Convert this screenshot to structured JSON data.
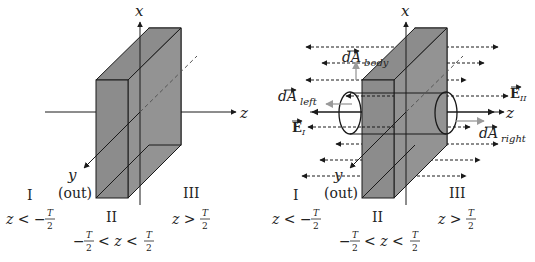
{
  "left_panel": {
    "axis_labels": {
      "x": "x",
      "z": "z",
      "y": "y",
      "y_note": "(out)"
    },
    "regions": [
      {
        "numeral": "I",
        "condition_lhs": "z < −",
        "frac_num": "T",
        "frac_den": "2"
      },
      {
        "numeral": "II",
        "condition_pre": "−",
        "frac_num": "T",
        "frac_den": "2",
        "condition_mid": "< z <",
        "frac2_num": "T",
        "frac2_den": "2"
      },
      {
        "numeral": "III",
        "condition_lhs": "z >",
        "frac_num": "T",
        "frac_den": "2"
      }
    ]
  },
  "right_panel": {
    "axis_labels": {
      "x": "x",
      "z": "z",
      "y": "y",
      "y_note": "(out)"
    },
    "vectors": {
      "dA_body": {
        "base": "dA",
        "sub": "body"
      },
      "dA_left": {
        "base": "dA",
        "sub": "left"
      },
      "dA_right": {
        "base": "dA",
        "sub": "right"
      },
      "E_I": {
        "base": "E",
        "sub": "I"
      },
      "E_II": {
        "base": "E",
        "sub": "II"
      }
    },
    "regions": [
      {
        "numeral": "I",
        "condition_lhs": "z < −",
        "frac_num": "T",
        "frac_den": "2"
      },
      {
        "numeral": "II",
        "condition_pre": "−",
        "frac_num": "T",
        "frac_den": "2",
        "condition_mid": "< z <",
        "frac2_num": "T",
        "frac2_den": "2"
      },
      {
        "numeral": "III",
        "condition_lhs": "z >",
        "frac_num": "T",
        "frac_den": "2"
      }
    ]
  },
  "colors": {
    "slab_fill": "#8c8c8c",
    "line": "#1a1a1a",
    "gray_arrow": "#9a9a9a",
    "background": "#ffffff"
  }
}
